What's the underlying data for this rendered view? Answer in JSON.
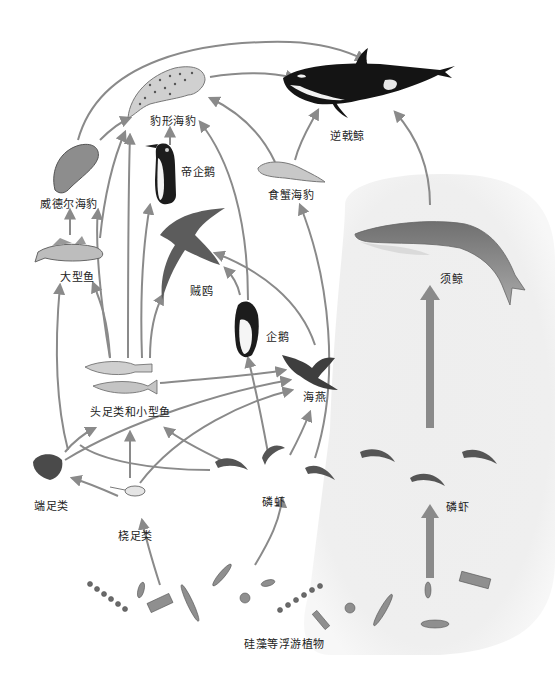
{
  "diagram": {
    "type": "food-web",
    "colors": {
      "arrow": "#8a8a8a",
      "baleen_path_bg": "#ececec",
      "label": "#222222",
      "orca_black": "#141414",
      "orca_white": "#f2f2f2",
      "whale_gray": "#8f8f8f"
    },
    "nodes": {
      "orca": {
        "label": "逆戟鲸"
      },
      "leopard_seal": {
        "label": "豹形海豹"
      },
      "emperor_penguin": {
        "label": "帝企鹅"
      },
      "weddell_seal": {
        "label": "威德尔海豹"
      },
      "crabeater_seal": {
        "label": "食蟹海豹"
      },
      "large_fish": {
        "label": "大型鱼"
      },
      "skua": {
        "label": "贼鸥"
      },
      "penguin": {
        "label": "企鹅"
      },
      "baleen_whale": {
        "label": "须鲸"
      },
      "cephalopods_small_fish": {
        "label": "头足类和小型鱼"
      },
      "petrel": {
        "label": "海燕"
      },
      "amphipods": {
        "label": "端足类"
      },
      "copepods": {
        "label": "桡足类"
      },
      "krill_left": {
        "label": "磷虾"
      },
      "krill_right": {
        "label": "磷虾"
      },
      "phytoplankton": {
        "label": "硅藻等浮游植物"
      }
    },
    "edges": [
      {
        "from": "weddell_seal",
        "to": "orca"
      },
      {
        "from": "leopard_seal",
        "to": "orca"
      },
      {
        "from": "crabeater_seal",
        "to": "orca"
      },
      {
        "from": "baleen_whale",
        "to": "orca"
      },
      {
        "from": "weddell_seal",
        "to": "leopard_seal"
      },
      {
        "from": "emperor_penguin",
        "to": "leopard_seal"
      },
      {
        "from": "large_fish",
        "to": "leopard_seal"
      },
      {
        "from": "cephalopods_small_fish",
        "to": "leopard_seal"
      },
      {
        "from": "penguin",
        "to": "leopard_seal"
      },
      {
        "from": "crabeater_seal",
        "to": "leopard_seal"
      },
      {
        "from": "krill_left",
        "to": "crabeater_seal"
      },
      {
        "from": "large_fish",
        "to": "weddell_seal"
      },
      {
        "from": "cephalopods_small_fish",
        "to": "weddell_seal"
      },
      {
        "from": "cephalopods_small_fish",
        "to": "emperor_penguin"
      },
      {
        "from": "cephalopods_small_fish",
        "to": "skua"
      },
      {
        "from": "penguin",
        "to": "skua"
      },
      {
        "from": "petrel",
        "to": "skua"
      },
      {
        "from": "cephalopods_small_fish",
        "to": "large_fish"
      },
      {
        "from": "amphipods",
        "to": "large_fish"
      },
      {
        "from": "cephalopods_small_fish",
        "to": "petrel"
      },
      {
        "from": "amphipods",
        "to": "petrel"
      },
      {
        "from": "copepods",
        "to": "petrel"
      },
      {
        "from": "krill_left",
        "to": "petrel"
      },
      {
        "from": "krill_left",
        "to": "penguin"
      },
      {
        "from": "amphipods",
        "to": "cephalopods_small_fish"
      },
      {
        "from": "copepods",
        "to": "cephalopods_small_fish"
      },
      {
        "from": "krill_left",
        "to": "cephalopods_small_fish"
      },
      {
        "from": "copepods",
        "to": "amphipods"
      },
      {
        "from": "phytoplankton",
        "to": "copepods"
      },
      {
        "from": "phytoplankton",
        "to": "krill_left"
      },
      {
        "from": "phytoplankton",
        "to": "krill_right"
      },
      {
        "from": "krill_right",
        "to": "baleen_whale"
      }
    ]
  }
}
